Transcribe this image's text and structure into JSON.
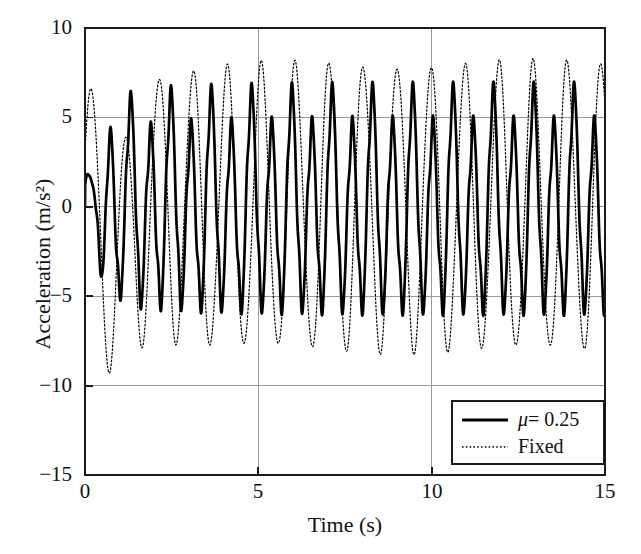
{
  "chart_data": {
    "type": "line",
    "title": "",
    "xlabel": "Time (s)",
    "ylabel": "Acceleration (m/s²)",
    "xlim": [
      0,
      15
    ],
    "ylim": [
      -15,
      10
    ],
    "xticks": [
      "0",
      "5",
      "10",
      "15"
    ],
    "xtick_values": [
      0,
      5,
      10,
      15
    ],
    "yticks": [
      "10",
      "5",
      "0",
      "−5",
      "−10",
      "−15"
    ],
    "ytick_values": [
      10,
      5,
      0,
      -5,
      -10,
      -15
    ],
    "grid": true,
    "legend_position": "lower right",
    "series": [
      {
        "name": "μ = 0.25",
        "style": "solid",
        "linewidth": 2.6,
        "color": "#000000",
        "description": "Friction-isolated response, higher frequency (~1.7 Hz), steady amplitude about ±5.5 m/s², starts at 0 and builds over first second",
        "frequency_hz": 1.72,
        "steady_amplitude": 5.5,
        "peak_amplitude": 6.2
      },
      {
        "name": "Fixed",
        "style": "dotted",
        "linewidth": 1.1,
        "color": "#000000",
        "description": "Fixed-base response, lower frequency (~1.0 Hz), steady amplitude about ±8 m/s², initial transient trough reaching −11 m/s² near t = 0.9 s",
        "frequency_hz": 1.02,
        "steady_amplitude": 8.0,
        "min_value": -11.2,
        "max_value": 9.3
      }
    ],
    "legend": [
      {
        "label_prefix": "μ",
        "label_suffix": " = 0.25",
        "style": "solid"
      },
      {
        "label_prefix": "",
        "label_suffix": "Fixed",
        "style": "dotted"
      }
    ]
  },
  "axes": {
    "ylabel": "Acceleration (m/s²)",
    "xlabel": "Time (s)",
    "ytick_labels": [
      "10",
      "5",
      "0",
      "−5",
      "−10",
      "−15"
    ],
    "xtick_labels": [
      "0",
      "5",
      "10",
      "15"
    ]
  },
  "legend": {
    "entry1_mu": "μ",
    "entry1_rest": "= 0.25",
    "entry2": "Fixed"
  },
  "colors": {
    "line": "#000000",
    "grid": "#9a9a9a",
    "frame": "#1a1a1a",
    "background": "#ffffff"
  }
}
